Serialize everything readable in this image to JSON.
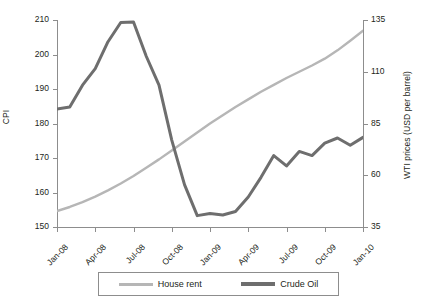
{
  "chart_data": {
    "type": "line",
    "title": "",
    "xlabel": "",
    "grid": false,
    "legend_position": "bottom",
    "x": [
      "Jan-08",
      "Feb-08",
      "Mar-08",
      "Apr-08",
      "May-08",
      "Jun-08",
      "Jul-08",
      "Aug-08",
      "Sep-08",
      "Oct-08",
      "Nov-08",
      "Dec-08",
      "Jan-09",
      "Feb-09",
      "Mar-09",
      "Apr-09",
      "May-09",
      "Jun-09",
      "Jul-09",
      "Aug-09",
      "Sep-09",
      "Oct-09",
      "Nov-09",
      "Dec-09",
      "Jan-10"
    ],
    "x_tick_labels": [
      "Jan-08",
      "Apr-08",
      "Jul-08",
      "Oct-08",
      "Jan-09",
      "Apr-09",
      "Jul-09",
      "Oct-09",
      "Jan-10"
    ],
    "axes": [
      {
        "id": "left",
        "ylabel": "CPI",
        "ylim": [
          150,
          210
        ],
        "ticks": [
          150,
          160,
          170,
          180,
          190,
          200,
          210
        ]
      },
      {
        "id": "right",
        "ylabel": "WTI prices (USD per barrel)",
        "ylim": [
          35,
          135
        ],
        "ticks": [
          35,
          60,
          85,
          110,
          135
        ]
      }
    ],
    "series": [
      {
        "name": "House rent",
        "axis": "left",
        "color": "#b6b6b6",
        "width": 2.4,
        "values": [
          154.6,
          155.8,
          157.2,
          158.8,
          160.6,
          162.6,
          164.8,
          167.2,
          169.6,
          172.2,
          174.8,
          177.4,
          180.0,
          182.4,
          184.8,
          187.0,
          189.2,
          191.2,
          193.2,
          195.0,
          196.8,
          198.8,
          201.2,
          204.0,
          206.9
        ]
      },
      {
        "name": "Crude Oil",
        "axis": "right",
        "color": "#6e6e6e",
        "width": 3.0,
        "values": [
          92.0,
          93.0,
          103.5,
          111.5,
          124.5,
          133.8,
          134.0,
          117.5,
          103.5,
          77.0,
          55.5,
          40.5,
          41.5,
          40.8,
          42.5,
          49.5,
          59.0,
          69.5,
          64.5,
          71.5,
          69.5,
          75.5,
          78.0,
          74.5,
          78.3
        ]
      }
    ]
  },
  "legend": {
    "entries": [
      {
        "label": "House rent",
        "color": "#b6b6b6"
      },
      {
        "label": "Crude Oil",
        "color": "#6e6e6e"
      }
    ]
  }
}
